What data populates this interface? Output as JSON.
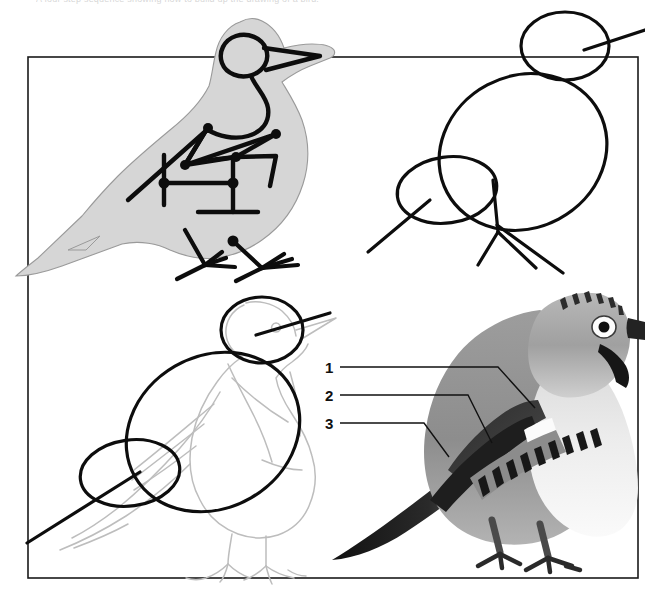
{
  "caption": {
    "text": "A four step sequence showing how to build up the drawing of a bird."
  },
  "frame": {
    "color": "#1a1a1a",
    "x": 28,
    "y": 57,
    "width": 610,
    "height": 521
  },
  "panels": [
    {
      "id": "panel-1",
      "name": "shaded-silhouette-with-skeleton",
      "position": "top-left",
      "description": "Light grey bird silhouette overlaid with a heavy black stick-figure skeleton showing wing, leg and body axes",
      "silhouette_fill": "#d6d6d6",
      "silhouette_stroke": "#8c8c8c",
      "skeleton_stroke": "#0d0d0d"
    },
    {
      "id": "panel-2",
      "name": "construction-ovals",
      "position": "top-right",
      "description": "Three construction ovals - head, body and wing - with straight lines for beak, tail and legs",
      "stroke": "#0d0d0d"
    },
    {
      "id": "panel-3",
      "name": "pencil-outline-over-ovals",
      "position": "bottom-left",
      "description": "Faint pencil outline of the finished bird drawn over the bold construction ovals",
      "outline_stroke": "#b9b9b9",
      "oval_stroke": "#0d0d0d"
    },
    {
      "id": "panel-4",
      "name": "finished-painting",
      "position": "bottom-right",
      "description": "Finished tonal painting of a jay with streaked crown, white eye ring, barred wing patch and black tail"
    }
  ],
  "annotations": {
    "leaders": [
      {
        "number": "1",
        "target": "mantle"
      },
      {
        "number": "2",
        "target": "wing-coverts"
      },
      {
        "number": "3",
        "target": "primaries"
      }
    ],
    "line_color": "#111111"
  },
  "colors": {
    "ink": "#0d0d0d",
    "pencil": "#b9b9b9",
    "grey_fill": "#d6d6d6",
    "paper": "#ffffff"
  }
}
